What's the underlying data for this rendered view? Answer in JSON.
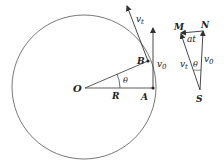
{
  "diagram": {
    "labels": {
      "O": "O",
      "A": "A",
      "B": "B",
      "R": "R",
      "theta_main": "θ",
      "v0_main": "v",
      "v0_main_sub": "0",
      "vt_main": "v",
      "vt_main_sub": "t",
      "M": "M",
      "N": "N",
      "S": "S",
      "at": "at",
      "vt_tri": "v",
      "vt_tri_sub": "t",
      "v0_tri": "v",
      "v0_tri_sub": "0",
      "theta_tri": "θ"
    },
    "colors": {
      "stroke": "#333333",
      "background": "#ffffff"
    }
  }
}
